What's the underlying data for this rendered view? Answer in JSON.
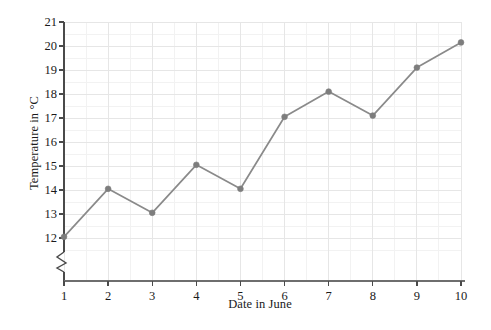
{
  "chart_data": {
    "type": "line",
    "title": "",
    "xlabel": "Date in June",
    "ylabel": "Temperature in °C",
    "x": [
      1,
      2,
      3,
      4,
      5,
      6,
      7,
      8,
      9,
      10
    ],
    "values": [
      12.05,
      14.05,
      13.05,
      15.05,
      14.05,
      17.05,
      18.1,
      17.1,
      19.1,
      20.15
    ],
    "xtick_labels": [
      "1",
      "2",
      "3",
      "4",
      "5",
      "6",
      "7",
      "8",
      "9",
      "10"
    ],
    "ytick_labels": [
      "12",
      "13",
      "14",
      "15",
      "16",
      "17",
      "18",
      "19",
      "20",
      "21"
    ],
    "ylim": [
      11.6,
      21
    ],
    "xlim": [
      1,
      10
    ],
    "y_axis_break": true,
    "grid": true,
    "grid_minor": true,
    "legend": "none",
    "series_color": "#8a8a8a",
    "marker_color": "#7d7d7d",
    "axis_color": "#4a4a4a",
    "grid_color": "#e6e6e6",
    "grid_minor_color": "#f2f2f2",
    "background": "#ffffff"
  }
}
